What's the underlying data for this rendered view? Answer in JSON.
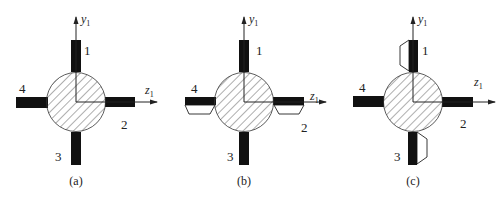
{
  "figure": {
    "panels": [
      {
        "id": "a",
        "caption": "(a)",
        "axis_y": {
          "name": "y",
          "sub": "1"
        },
        "axis_z": {
          "name": "z",
          "sub": "1"
        },
        "arm_labels": [
          "1",
          "2",
          "3",
          "4"
        ],
        "center": [
          76,
          102
        ],
        "outlined_blocks": []
      },
      {
        "id": "b",
        "caption": "(b)",
        "axis_y": {
          "name": "y",
          "sub": "1"
        },
        "axis_z": {
          "name": "z",
          "sub": "1"
        },
        "arm_labels": [
          "1",
          "2",
          "3",
          "4"
        ],
        "center": [
          244,
          102
        ],
        "outlined_blocks": [
          "below-arm-2",
          "below-arm-4"
        ]
      },
      {
        "id": "c",
        "caption": "(c)",
        "axis_y": {
          "name": "y",
          "sub": "1"
        },
        "axis_z": {
          "name": "z",
          "sub": "1"
        },
        "arm_labels": [
          "1",
          "2",
          "3",
          "4"
        ],
        "center": [
          413,
          102
        ],
        "outlined_blocks": [
          "left-of-arm-1",
          "right-of-arm-3"
        ]
      }
    ],
    "colors": {
      "stroke": "#222222",
      "fill_arm": "#111111",
      "background": "#ffffff"
    }
  }
}
